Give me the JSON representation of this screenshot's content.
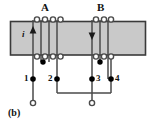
{
  "figure": {
    "caption": "(b)",
    "type": "transformer-winding-schematic",
    "core": {
      "fill": "#c9c9c9",
      "stroke": "#3a3a3a",
      "x": 10,
      "y": 21,
      "width": 136,
      "height": 34
    },
    "wire_color": "#4a4a4a",
    "dot_color": "#000000",
    "windings": [
      {
        "id": "A",
        "label": "A",
        "label_x": 44,
        "label_y": 3,
        "turns": 4,
        "lead_xs": [
          33,
          41,
          49,
          57
        ],
        "loop_xs": [
          37,
          45,
          53,
          60
        ],
        "current_label": "i",
        "current_label_x": 22,
        "current_label_y": 33,
        "current_arrow_direction": "up",
        "current_arrow_x": 33,
        "polarity_dot_x": 43,
        "polarity_dot_y": 62
      },
      {
        "id": "B",
        "label": "B",
        "label_x": 100,
        "label_y": 3,
        "turns": 3,
        "lead_xs": [
          92,
          100,
          108
        ],
        "loop_xs": [
          96,
          104,
          111
        ],
        "current_label": "",
        "current_arrow_direction": "down",
        "current_arrow_x": 92,
        "polarity_dot_x": 100,
        "polarity_dot_y": 62
      }
    ],
    "terminals": [
      {
        "label": "1",
        "x": 33,
        "y": 79,
        "label_side": "left"
      },
      {
        "label": "2",
        "x": 57,
        "y": 79,
        "label_side": "left"
      },
      {
        "label": "3",
        "x": 92,
        "y": 79,
        "label_side": "right"
      },
      {
        "label": "4",
        "x": 111,
        "y": 79,
        "label_side": "right"
      }
    ],
    "open_terminals": [
      {
        "name": "output-terminal-left",
        "x": 33,
        "y": 103
      },
      {
        "name": "output-terminal-right",
        "x": 92,
        "y": 103
      }
    ],
    "jumper": {
      "name": "series-jumper-2-to-4",
      "from_x": 57,
      "to_x": 111,
      "y": 93
    }
  }
}
